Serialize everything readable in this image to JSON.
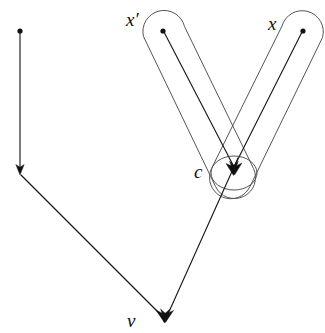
{
  "figure": {
    "background_color": "#ffffff",
    "width": 325,
    "height": 333,
    "labels": {
      "x_prime": "x′",
      "x": "x",
      "c": "c",
      "v": "v"
    },
    "colors": {
      "edge": "#1a1a1a",
      "capsule": "#555555",
      "node": "#111111",
      "label": "#111111"
    },
    "nodes": [
      {
        "id": "n-top-left",
        "label": "",
        "x": 20,
        "y": 31,
        "kind": "dot"
      },
      {
        "id": "n-mid-left",
        "label": "",
        "x": 20,
        "y": 172,
        "kind": "arrow-target"
      },
      {
        "id": "n-x-prime",
        "label": "x′",
        "x": 163,
        "y": 31,
        "kind": "dot"
      },
      {
        "id": "n-x",
        "label": "x",
        "x": 303,
        "y": 31,
        "kind": "dot"
      },
      {
        "id": "n-c",
        "label": "c",
        "x": 233,
        "y": 170,
        "kind": "arrow-target"
      },
      {
        "id": "n-v",
        "label": "v",
        "x": 165,
        "y": 319,
        "kind": "arrow-target"
      }
    ],
    "edges": [
      {
        "id": "e-topleft-to-midleft",
        "from": "n-top-left",
        "to": "n-mid-left",
        "arrow": true
      },
      {
        "id": "e-midleft-to-v",
        "from": "n-mid-left",
        "to": "n-v",
        "arrow": true
      },
      {
        "id": "e-xprime-to-c",
        "from": "n-x-prime",
        "to": "n-c",
        "arrow": true
      },
      {
        "id": "e-x-to-c",
        "from": "n-x",
        "to": "n-c",
        "arrow": true
      },
      {
        "id": "e-c-to-v",
        "from": "n-c",
        "to": "n-v",
        "arrow": true
      }
    ],
    "capsules": [
      {
        "id": "capsule-x-prime",
        "encloses": "x′ to c path"
      },
      {
        "id": "capsule-x",
        "encloses": "x to c path"
      },
      {
        "id": "capsule-c",
        "encloses": "c node"
      }
    ]
  }
}
